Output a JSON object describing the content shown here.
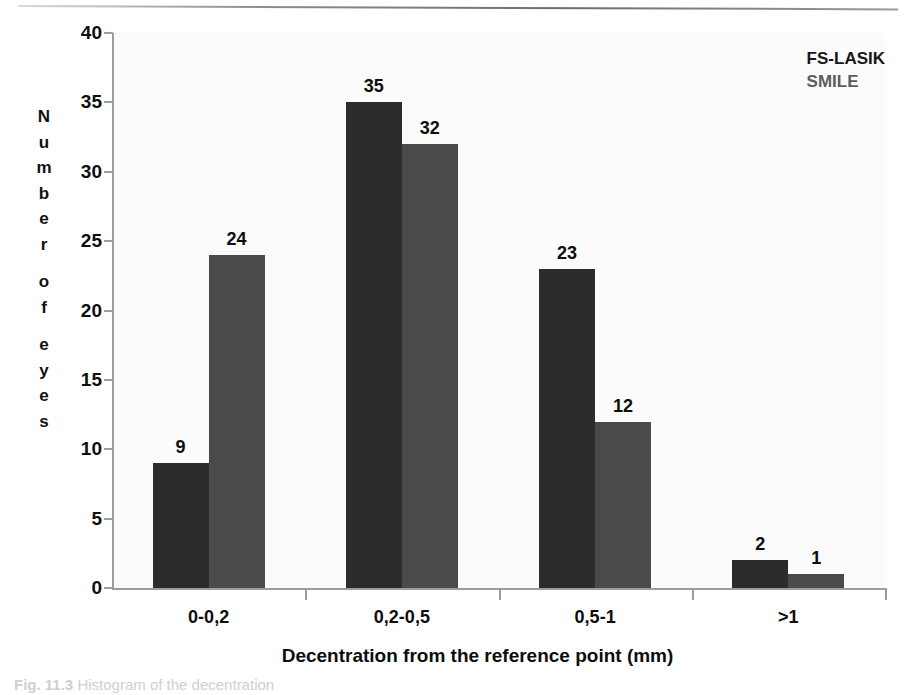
{
  "chart_data": {
    "type": "bar",
    "title": "",
    "subtitle": "",
    "xlabel": "Decentration from the reference point (mm)",
    "ylabel": "Number of eyes",
    "categories": [
      "0-0,2",
      "0,2-0,5",
      "0,5-1",
      ">1"
    ],
    "series": [
      {
        "name": "FS-LASIK",
        "color": "#2c2c2c",
        "values": [
          9,
          35,
          23,
          2
        ]
      },
      {
        "name": "SMILE",
        "color": "#4a4a4a",
        "values": [
          24,
          32,
          12,
          1
        ]
      }
    ],
    "ylim": [
      0,
      40
    ],
    "yticks": [
      0,
      5,
      10,
      15,
      20,
      25,
      30,
      35,
      40
    ],
    "grid": false,
    "legend_position": "top-right",
    "data_labels": true
  },
  "legend": {
    "entries": [
      {
        "label": "FS-LASIK"
      },
      {
        "label": "SMILE"
      }
    ]
  },
  "caption": {
    "figure_number": "Fig. 11.3",
    "text": "Histogram of the decentration"
  }
}
